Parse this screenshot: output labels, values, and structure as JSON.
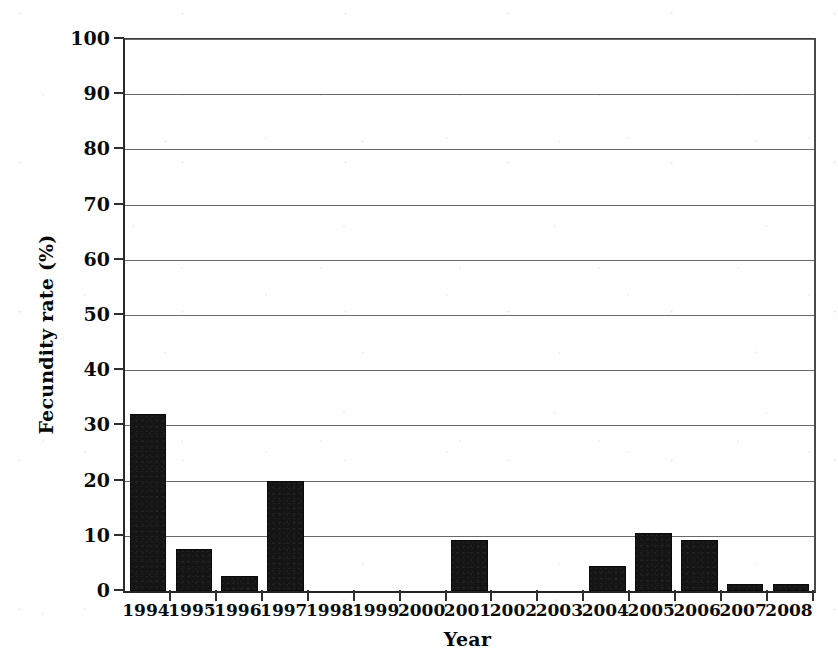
{
  "figure": {
    "width": 838,
    "height": 669,
    "background_color": "#ffffff",
    "bar_color": "#151515",
    "axis_color": "#2b2b2b",
    "grid_color": "#4f4f4f"
  },
  "axes": {
    "x_title": "Year",
    "y_title": "Fecundity rate (%)",
    "y_ticks": [
      "0",
      "10",
      "20",
      "30",
      "40",
      "50",
      "60",
      "70",
      "80",
      "90",
      "100"
    ],
    "x_ticks": [
      "1994",
      "1995",
      "1996",
      "1997",
      "1998",
      "1999",
      "2000",
      "2001",
      "2002",
      "2003",
      "2004",
      "2005",
      "2006",
      "2007",
      "2008"
    ]
  },
  "chart_data": {
    "type": "bar",
    "title": "",
    "xlabel": "Year",
    "ylabel": "Fecundity rate (%)",
    "categories": [
      "1994",
      "1995",
      "1996",
      "1997",
      "1998",
      "1999",
      "2000",
      "2001",
      "2002",
      "2003",
      "2004",
      "2005",
      "2006",
      "2007",
      "2008"
    ],
    "values": [
      32,
      7.6,
      2.8,
      20,
      0,
      0,
      0,
      9.3,
      0,
      0,
      4.6,
      10.5,
      9.3,
      1.3,
      1.2
    ],
    "ylim": [
      0,
      100
    ],
    "ytick_step": 10,
    "grid": "horizontal",
    "legend": "none",
    "series": [
      {
        "name": "Fecundity rate",
        "values": [
          32,
          7.6,
          2.8,
          20,
          0,
          0,
          0,
          9.3,
          0,
          0,
          4.6,
          10.5,
          9.3,
          1.3,
          1.2
        ]
      }
    ]
  }
}
